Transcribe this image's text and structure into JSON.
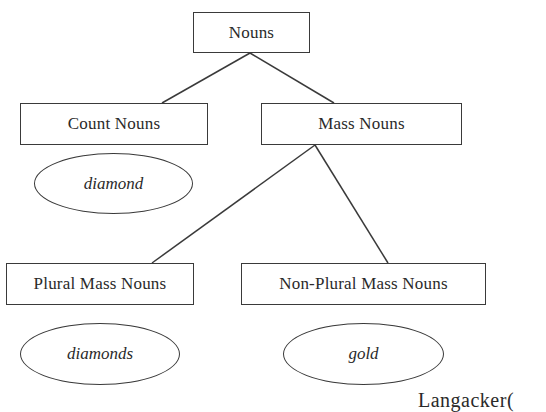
{
  "diagram": {
    "type": "tree",
    "nodes": {
      "root": {
        "label": "Nouns",
        "shape": "box"
      },
      "count": {
        "label": "Count Nouns",
        "shape": "box"
      },
      "mass": {
        "label": "Mass Nouns",
        "shape": "box"
      },
      "plural_mass": {
        "label": "Plural Mass Nouns",
        "shape": "box"
      },
      "non_plural_mass": {
        "label": "Non-Plural Mass Nouns",
        "shape": "box"
      }
    },
    "examples": {
      "count": {
        "label": "diamond",
        "shape": "ellipse"
      },
      "plural_mass": {
        "label": "diamonds",
        "shape": "ellipse"
      },
      "non_plural_mass": {
        "label": "gold",
        "shape": "ellipse"
      }
    },
    "edges": [
      {
        "from": "Nouns",
        "to": "Count Nouns"
      },
      {
        "from": "Nouns",
        "to": "Mass Nouns"
      },
      {
        "from": "Mass Nouns",
        "to": "Plural Mass Nouns"
      },
      {
        "from": "Mass Nouns",
        "to": "Non-Plural Mass Nouns"
      }
    ],
    "caption": "Langacker("
  }
}
